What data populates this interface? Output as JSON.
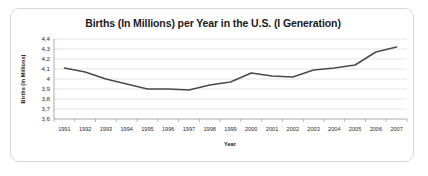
{
  "chart_data": {
    "type": "line",
    "title": "Births (In Millions) per Year in the U.S. (I Generation)",
    "xlabel": "Year",
    "ylabel": "Births (In Millions)",
    "categories": [
      "1991",
      "1992",
      "1993",
      "1994",
      "1995",
      "1996",
      "1997",
      "1998",
      "1999",
      "2000",
      "2001",
      "2002",
      "2003",
      "2004",
      "2005",
      "2006",
      "2007"
    ],
    "values": [
      4.11,
      4.07,
      4.0,
      3.95,
      3.9,
      3.9,
      3.89,
      3.94,
      3.97,
      4.06,
      4.03,
      4.02,
      4.09,
      4.11,
      4.14,
      4.27,
      4.32
    ],
    "ytick_labels": [
      "4,4",
      "4,3",
      "4,2",
      "4,1",
      "4",
      "3,9",
      "3,8",
      "3,7",
      "3,6"
    ],
    "ytick_values": [
      4.4,
      4.3,
      4.2,
      4.1,
      4.0,
      3.9,
      3.8,
      3.7,
      3.6
    ],
    "ylim": [
      3.6,
      4.4
    ],
    "grid": true,
    "legend": "none",
    "series_color": "#4a4a4a",
    "grid_color": "#d0d0d0",
    "axis_color": "#9a9a9a",
    "frame_color": "#d8d8d8",
    "background": "#ffffff"
  }
}
